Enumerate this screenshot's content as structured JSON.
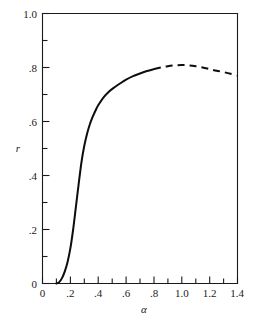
{
  "chart_data": {
    "type": "line",
    "title": "",
    "subtitle": "",
    "xlabel": "α",
    "ylabel": "r",
    "xlim": [
      0,
      1.4
    ],
    "ylim": [
      0,
      1.0
    ],
    "grid": false,
    "legend": "none",
    "x_ticks": [
      0,
      0.2,
      0.4,
      0.6,
      0.8,
      1.0,
      1.2,
      1.4
    ],
    "x_tick_labels": [
      "0",
      ".2",
      ".4",
      ".6",
      ".8",
      "1.0",
      "1.2",
      "1.4"
    ],
    "x_minor_ticks": [
      0.1,
      0.3,
      0.5,
      0.7,
      0.9,
      1.1,
      1.3
    ],
    "y_ticks": [
      0,
      0.2,
      0.4,
      0.6,
      0.8,
      1.0
    ],
    "y_tick_labels": [
      "0",
      ".2",
      ".4",
      ".6",
      ".8",
      "1.0"
    ],
    "y_minor_ticks": [
      0.1,
      0.3,
      0.5,
      0.7,
      0.9
    ],
    "series": [
      {
        "name": "r-solid-branch",
        "style": "solid",
        "x": [
          0.1,
          0.12,
          0.14,
          0.16,
          0.18,
          0.2,
          0.22,
          0.24,
          0.26,
          0.28,
          0.3,
          0.32,
          0.34,
          0.36,
          0.38,
          0.4,
          0.44,
          0.48,
          0.52,
          0.56,
          0.6,
          0.65,
          0.7,
          0.75,
          0.8
        ],
        "y": [
          0.0,
          0.005,
          0.02,
          0.045,
          0.08,
          0.13,
          0.2,
          0.285,
          0.37,
          0.45,
          0.51,
          0.555,
          0.59,
          0.617,
          0.64,
          0.66,
          0.69,
          0.712,
          0.728,
          0.742,
          0.755,
          0.768,
          0.778,
          0.787,
          0.794
        ]
      },
      {
        "name": "r-dashed-branch",
        "style": "dashed",
        "x": [
          0.8,
          0.85,
          0.9,
          0.95,
          1.0,
          1.05,
          1.1,
          1.15,
          1.2,
          1.25,
          1.3,
          1.35,
          1.4
        ],
        "y": [
          0.794,
          0.8,
          0.805,
          0.808,
          0.809,
          0.808,
          0.805,
          0.8,
          0.794,
          0.788,
          0.783,
          0.777,
          0.77
        ]
      }
    ],
    "annotations": []
  },
  "axes": {
    "y_axis_label": "r",
    "x_axis_label": "α",
    "y_labels": [
      "1.0",
      ".8",
      ".6",
      ".4",
      ".2",
      "0"
    ],
    "x_labels": [
      "0",
      ".2",
      ".4",
      ".6",
      ".8",
      "1.0",
      "1.2",
      "1.4"
    ]
  },
  "colors": {
    "curve": "#0d0d0d",
    "frame": "#1a1a1a",
    "background": "#ffffff",
    "text": "#1a1a1a"
  }
}
